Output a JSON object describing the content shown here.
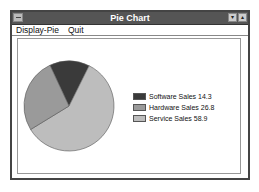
{
  "window": {
    "title": "Pie Chart",
    "buttons": {
      "minimize": "▾",
      "maximize": "▴"
    }
  },
  "menu": {
    "items": [
      {
        "label": "Display-Pie",
        "accel": "D"
      },
      {
        "label": "Quit",
        "accel": "Q"
      }
    ]
  },
  "legend": [
    {
      "label": "Software Sales 14.3",
      "color": "#3a3a3a"
    },
    {
      "label": "Hardware Sales 26.8",
      "color": "#9a9a9a"
    },
    {
      "label": "Service Sales 58.9",
      "color": "#bdbdbd"
    }
  ],
  "chart_data": {
    "type": "pie",
    "categories": [
      "Software Sales",
      "Hardware Sales",
      "Service Sales"
    ],
    "values": [
      14.3,
      26.8,
      58.9
    ],
    "colors": [
      "#3a3a3a",
      "#9a9a9a",
      "#bdbdbd"
    ],
    "title": "Pie Chart",
    "legend_position": "right"
  }
}
